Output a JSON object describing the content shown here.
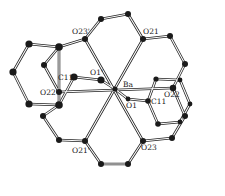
{
  "figure": {
    "type": "crystal-structure-diagram",
    "central_atom": "Ba"
  },
  "labels": {
    "Ba": "Ba",
    "O21": "O21",
    "O23p": "O23'",
    "O1p": "O1'",
    "C11p": "C11'",
    "O22p": "O22'",
    "O22": "O22",
    "O1": "O1",
    "C11": "C11",
    "O21p": "O21'",
    "O23": "O23"
  },
  "atoms": [
    {
      "id": "Ba",
      "x": 115,
      "y": 89,
      "r": 2.6
    },
    {
      "id": "O21",
      "x": 143,
      "y": 39,
      "r": 3.0
    },
    {
      "id": "O23p",
      "x": 85,
      "y": 39,
      "r": 3.0
    },
    {
      "id": "t1",
      "x": 101,
      "y": 19,
      "r": 3.0
    },
    {
      "id": "t2",
      "x": 128,
      "y": 14,
      "r": 3.0
    },
    {
      "id": "r1",
      "x": 170,
      "y": 36,
      "r": 3.0
    },
    {
      "id": "r2",
      "x": 185,
      "y": 64,
      "r": 3.0
    },
    {
      "id": "O22",
      "x": 173,
      "y": 88,
      "r": 3.2
    },
    {
      "id": "O21p",
      "x": 85,
      "y": 141,
      "r": 3.0
    },
    {
      "id": "O23",
      "x": 143,
      "y": 141,
      "r": 3.0
    },
    {
      "id": "b1",
      "x": 101,
      "y": 164,
      "r": 3.0
    },
    {
      "id": "b2",
      "x": 128,
      "y": 164,
      "r": 3.0
    },
    {
      "id": "l1",
      "x": 59,
      "y": 140,
      "r": 3.0
    },
    {
      "id": "l2",
      "x": 43,
      "y": 116,
      "r": 3.0
    },
    {
      "id": "O22p",
      "x": 59,
      "y": 92,
      "r": 3.0
    },
    {
      "id": "C11p",
      "x": 74,
      "y": 77,
      "r": 3.6
    },
    {
      "id": "O1p",
      "x": 101,
      "y": 80,
      "r": 3.6
    },
    {
      "id": "O1",
      "x": 128,
      "y": 99,
      "r": 2.4
    },
    {
      "id": "C11",
      "x": 148,
      "y": 101,
      "r": 2.8
    },
    {
      "id": "L1",
      "x": 59,
      "y": 47,
      "r": 3.8
    },
    {
      "id": "L2",
      "x": 29,
      "y": 44,
      "r": 3.6
    },
    {
      "id": "L3",
      "x": 13,
      "y": 72,
      "r": 3.6
    },
    {
      "id": "L4",
      "x": 29,
      "y": 104,
      "r": 3.6
    },
    {
      "id": "L5",
      "x": 59,
      "y": 105,
      "r": 3.8
    },
    {
      "id": "L6",
      "x": 44,
      "y": 65,
      "r": 3.0
    },
    {
      "id": "R1",
      "x": 156,
      "y": 79,
      "r": 2.6
    },
    {
      "id": "R2",
      "x": 180,
      "y": 80,
      "r": 2.4
    },
    {
      "id": "R3",
      "x": 190,
      "y": 104,
      "r": 2.4
    },
    {
      "id": "R4",
      "x": 185,
      "y": 116,
      "r": 3.0
    },
    {
      "id": "R5",
      "x": 172,
      "y": 138,
      "r": 3.0
    },
    {
      "id": "R6",
      "x": 158,
      "y": 124,
      "r": 2.8
    },
    {
      "id": "R7",
      "x": 180,
      "y": 122,
      "r": 2.4
    }
  ],
  "bonds": [
    [
      "O23p",
      "t1"
    ],
    [
      "t1",
      "t2"
    ],
    [
      "t2",
      "O21"
    ],
    [
      "O21",
      "r1"
    ],
    [
      "r1",
      "r2"
    ],
    [
      "r2",
      "O22"
    ],
    [
      "O23p",
      "O23"
    ],
    [
      "O21",
      "O21p"
    ],
    [
      "O21p",
      "b1"
    ],
    [
      "b1",
      "b2"
    ],
    [
      "b2",
      "O23"
    ],
    [
      "O21p",
      "l1"
    ],
    [
      "l1",
      "l2"
    ],
    [
      "l2",
      "L5"
    ],
    [
      "O23",
      "R5"
    ],
    [
      "R5",
      "R4"
    ],
    [
      "R4",
      "O22"
    ],
    [
      "O23p",
      "L1"
    ],
    [
      "L1",
      "L2"
    ],
    [
      "L2",
      "L3"
    ],
    [
      "L3",
      "L4"
    ],
    [
      "L4",
      "L5"
    ],
    [
      "L5",
      "L1"
    ],
    [
      "L1",
      "L6"
    ],
    [
      "L6",
      "O22p"
    ],
    [
      "C11p",
      "L5"
    ],
    [
      "C11p",
      "O1p"
    ],
    [
      "O1p",
      "Ba"
    ],
    [
      "Ba",
      "O1"
    ],
    [
      "O1",
      "C11"
    ],
    [
      "O22p",
      "O22"
    ],
    [
      "C11",
      "R6"
    ],
    [
      "R6",
      "R7"
    ],
    [
      "R7",
      "R3"
    ],
    [
      "R3",
      "R2"
    ],
    [
      "R2",
      "R1"
    ],
    [
      "R1",
      "C11"
    ]
  ],
  "label_positions": {
    "Ba": {
      "x": 123,
      "y": 87
    },
    "O21": {
      "x": 143,
      "y": 34
    },
    "O23p": {
      "x": 72,
      "y": 34
    },
    "O1p": {
      "x": 90,
      "y": 75
    },
    "C11p": {
      "x": 58,
      "y": 80
    },
    "O22p": {
      "x": 40,
      "y": 95
    },
    "O22": {
      "x": 164,
      "y": 97
    },
    "O1": {
      "x": 126,
      "y": 108
    },
    "C11": {
      "x": 151,
      "y": 104
    },
    "O21p": {
      "x": 72,
      "y": 153
    },
    "O23": {
      "x": 141,
      "y": 150
    }
  }
}
